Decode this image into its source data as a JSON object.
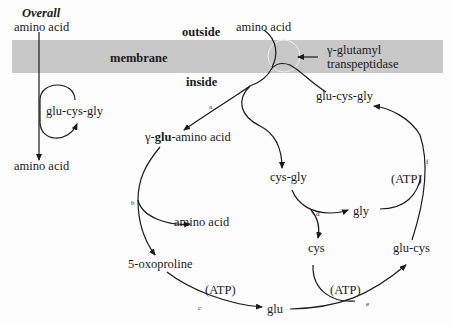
{
  "overall": {
    "title": "Overall",
    "top_label": "amino acid",
    "cycle_label": "glu-cys-gly",
    "bottom_label": "amino acid"
  },
  "membrane": {
    "label": "membrane",
    "outside": "outside",
    "inside": "inside",
    "enzyme_line1": "γ-glutamyl",
    "enzyme_line2": "transpeptidase"
  },
  "nodes": {
    "amino_acid_outside": "amino acid",
    "glu_cys_gly": "glu-cys-gly",
    "gamma_prefix": "γ-",
    "gamma_glu": "glu",
    "gamma_suffix": "-amino acid",
    "amino_acid_released": "amino acid",
    "oxoproline": "5-oxoproline",
    "glu": "glu",
    "cys_gly": "cys-gly",
    "gly": "gly",
    "cys": "cys",
    "glu_cys": "glu-cys",
    "atp_c": "(ATP)",
    "atp_e": "(ATP)",
    "atp_f": "(ATP)"
  },
  "steps": {
    "a": "a",
    "b": "b",
    "c": "c",
    "d": "d",
    "e": "e",
    "f": "f"
  },
  "colors": {
    "membrane": "#c8c8c8",
    "ink": "#1a1a1a"
  }
}
